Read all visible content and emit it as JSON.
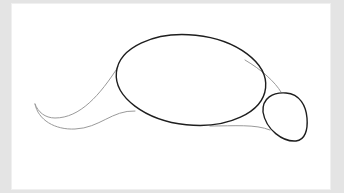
{
  "image": {
    "subject": "pencil sketch of an animal body outline",
    "parts": [
      "body-oval",
      "head-circle",
      "tail-curve",
      "guide-lines"
    ]
  },
  "colors": {
    "frame": "#e4e4e4",
    "canvas": "#ffffff",
    "dark_stroke": "#1e1e1e",
    "light_stroke": "#9a9a9a"
  }
}
